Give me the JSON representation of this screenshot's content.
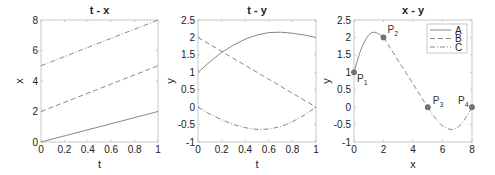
{
  "chart_data": [
    {
      "type": "line",
      "title": "t - x",
      "xlabel": "t",
      "ylabel": "x",
      "xlim": [
        0,
        1
      ],
      "ylim": [
        0,
        8
      ],
      "xticks": [
        "0",
        "0.2",
        "0.4",
        "0.6",
        "0.8",
        "1"
      ],
      "yticks": [
        "0",
        "2",
        "4",
        "6",
        "8"
      ],
      "grid": false,
      "series": [
        {
          "name": "A",
          "style": "solid",
          "x": [
            0,
            1
          ],
          "values": [
            0,
            2
          ]
        },
        {
          "name": "B",
          "style": "dashed",
          "x": [
            0,
            1
          ],
          "values": [
            2,
            5
          ]
        },
        {
          "name": "C",
          "style": "dashdot",
          "x": [
            0,
            1
          ],
          "values": [
            5,
            8
          ]
        }
      ]
    },
    {
      "type": "line",
      "title": "t - y",
      "xlabel": "t",
      "ylabel": "y",
      "xlim": [
        0,
        1
      ],
      "ylim": [
        -1,
        2.5
      ],
      "xticks": [
        "0",
        "0.2",
        "0.4",
        "0.6",
        "0.8",
        "1"
      ],
      "yticks": [
        "-1",
        "-0.5",
        "0",
        "0.5",
        "1",
        "1.5",
        "2",
        "2.5"
      ],
      "grid": false,
      "series": [
        {
          "name": "A",
          "style": "solid",
          "x": [
            0,
            0.1,
            0.2,
            0.3,
            0.4,
            0.5,
            0.6,
            0.7,
            0.8,
            0.9,
            1.0
          ],
          "values": [
            1.0,
            1.3,
            1.57,
            1.78,
            1.95,
            2.07,
            2.14,
            2.15,
            2.12,
            2.07,
            2.0
          ]
        },
        {
          "name": "B",
          "style": "dashed",
          "x": [
            0,
            1
          ],
          "values": [
            2,
            0
          ]
        },
        {
          "name": "C",
          "style": "dashdot",
          "x": [
            0,
            0.1,
            0.2,
            0.3,
            0.4,
            0.5,
            0.6,
            0.7,
            0.8,
            0.9,
            1.0
          ],
          "values": [
            0,
            -0.2,
            -0.36,
            -0.5,
            -0.59,
            -0.64,
            -0.63,
            -0.56,
            -0.42,
            -0.23,
            0
          ]
        }
      ]
    },
    {
      "type": "line",
      "title": "x - y",
      "xlabel": "x",
      "ylabel": "y",
      "xlim": [
        0,
        8
      ],
      "ylim": [
        -1,
        2.5
      ],
      "xticks": [
        "0",
        "2",
        "4",
        "6",
        "8"
      ],
      "yticks": [
        "-1",
        "-0.5",
        "0",
        "0.5",
        "1",
        "1.5",
        "2",
        "2.5"
      ],
      "grid": false,
      "legend": {
        "position": "upper right",
        "entries": [
          "A",
          "B",
          "C"
        ]
      },
      "series": [
        {
          "name": "A",
          "style": "solid",
          "x": [
            0,
            0.2,
            0.4,
            0.6,
            0.8,
            1.0,
            1.2,
            1.4,
            1.6,
            1.8,
            2.0
          ],
          "values": [
            1.0,
            1.3,
            1.57,
            1.78,
            1.95,
            2.07,
            2.14,
            2.15,
            2.12,
            2.07,
            2.0
          ]
        },
        {
          "name": "B",
          "style": "dashed",
          "x": [
            2,
            2.5,
            3,
            3.5,
            4,
            4.5,
            5
          ],
          "values": [
            2,
            1.67,
            1.33,
            1.0,
            0.67,
            0.33,
            0
          ]
        },
        {
          "name": "C",
          "style": "dashdot",
          "x": [
            5,
            5.3,
            5.6,
            5.9,
            6.2,
            6.5,
            6.8,
            7.1,
            7.4,
            7.7,
            8.0
          ],
          "values": [
            0,
            -0.2,
            -0.36,
            -0.5,
            -0.59,
            -0.64,
            -0.63,
            -0.56,
            -0.42,
            -0.23,
            0
          ]
        }
      ],
      "annotations": [
        {
          "label": "P1",
          "x": 0,
          "y": 1
        },
        {
          "label": "P2",
          "x": 2,
          "y": 2
        },
        {
          "label": "P3",
          "x": 5,
          "y": 0
        },
        {
          "label": "P4",
          "x": 8,
          "y": 0
        }
      ]
    }
  ],
  "colors": {
    "axis": "#c8c8c8",
    "line": "#888888",
    "text": "#222222",
    "marker": "#777777"
  }
}
